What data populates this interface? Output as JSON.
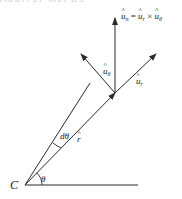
{
  "figure": {
    "cutoff_header": "ORBITAL MECHANICS",
    "origin_label": "C",
    "angle_label": "θ",
    "dtheta_label": "dθ",
    "position_vector_label": "r",
    "unit_vectors": {
      "u_n": {
        "base": "u",
        "sub": "n"
      },
      "u_theta": {
        "base": "u",
        "sub": "θ"
      },
      "u_r": {
        "base": "u",
        "sub": "r"
      }
    },
    "equation": {
      "lhs_base": "u",
      "lhs_sub": "n",
      "equals": "=",
      "a_base": "u",
      "a_sub": "r",
      "times": "×",
      "b_base": "u",
      "b_sub": "θ"
    },
    "colors": {
      "line": "#2a2a2a",
      "text": "#222222"
    }
  }
}
